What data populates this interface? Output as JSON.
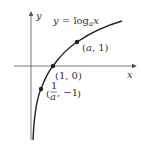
{
  "figure": {
    "function_label": {
      "prefix": "y = log",
      "base": "a",
      "arg": "x"
    },
    "axes": {
      "x_label": "x",
      "y_label": "y"
    },
    "points": [
      {
        "id": "a-1",
        "label": "(a, 1)",
        "x": "a",
        "y": "1"
      },
      {
        "id": "1-0",
        "label": "(1, 0)",
        "x": "1",
        "y": "0"
      },
      {
        "id": "inv-a",
        "label_frac_num": "1",
        "label_frac_den": "a",
        "label_y": ", −1",
        "x": "1/a",
        "y": "-1"
      }
    ],
    "colors": {
      "curve": "#222222",
      "axes": "#555555",
      "text": "#333333"
    }
  }
}
